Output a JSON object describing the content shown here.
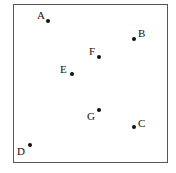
{
  "diagram": {
    "type": "scatter-points",
    "frame": {
      "left": 13,
      "top": 4,
      "right": 168,
      "bottom": 163
    },
    "points": [
      {
        "label": "A",
        "x": 48,
        "y": 21,
        "lx": 37,
        "ly": 10
      },
      {
        "label": "B",
        "x": 134,
        "y": 39,
        "lx": 138,
        "ly": 28
      },
      {
        "label": "F",
        "x": 99,
        "y": 57,
        "lx": 89,
        "ly": 46
      },
      {
        "label": "E",
        "x": 72,
        "y": 74,
        "lx": 60,
        "ly": 64
      },
      {
        "label": "G",
        "x": 99,
        "y": 110,
        "lx": 87,
        "ly": 111
      },
      {
        "label": "C",
        "x": 134,
        "y": 127,
        "lx": 138,
        "ly": 118
      },
      {
        "label": "D",
        "x": 30,
        "y": 145,
        "lx": 17,
        "ly": 146
      }
    ]
  },
  "chart_data": {
    "type": "scatter",
    "title": "",
    "xlabel": "",
    "ylabel": "",
    "points": [
      {
        "label": "A",
        "x": 48,
        "y": 21
      },
      {
        "label": "B",
        "x": 134,
        "y": 39
      },
      {
        "label": "F",
        "x": 99,
        "y": 57
      },
      {
        "label": "E",
        "x": 72,
        "y": 74
      },
      {
        "label": "G",
        "x": 99,
        "y": 110
      },
      {
        "label": "C",
        "x": 134,
        "y": 127
      },
      {
        "label": "D",
        "x": 30,
        "y": 145
      }
    ]
  }
}
